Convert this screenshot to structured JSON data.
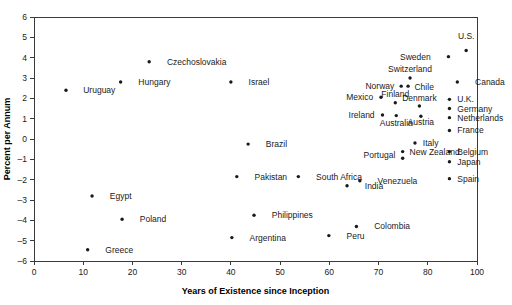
{
  "chart_data": {
    "type": "scatter",
    "title": "",
    "xlabel": "Years of Existence since Inception",
    "ylabel": "Percent per Annum",
    "xlim": [
      0,
      100
    ],
    "ylim": [
      -6,
      6
    ],
    "grid": false,
    "legend": "none",
    "xticks": [
      "0",
      "10",
      "20",
      "30",
      "40",
      "50",
      "60",
      "70",
      "80",
      "100"
    ],
    "yticks": [
      "6",
      "5",
      "4",
      "3",
      "2",
      "1",
      "0",
      "-1",
      "-2",
      "-3",
      "-4",
      "-5",
      "-6"
    ],
    "points": [
      {
        "label": "Uruguay",
        "x": 6.5,
        "y": 2.4,
        "lx": 10,
        "ly": 2.4,
        "anchor": "start"
      },
      {
        "label": "Hungary",
        "x": 17.6,
        "y": 2.8,
        "lx": 21.2,
        "ly": 2.8,
        "anchor": "start"
      },
      {
        "label": "Czechoslovakia",
        "x": 23.4,
        "y": 3.8,
        "lx": 27.0,
        "ly": 3.8,
        "anchor": "start"
      },
      {
        "label": "Israel",
        "x": 40.0,
        "y": 2.8,
        "lx": 43.6,
        "ly": 2.8,
        "anchor": "start"
      },
      {
        "label": "Brazil",
        "x": 43.5,
        "y": -0.25,
        "lx": 47.1,
        "ly": -0.25,
        "anchor": "start"
      },
      {
        "label": "Egypt",
        "x": 11.8,
        "y": -2.8,
        "lx": 15.4,
        "ly": -2.8,
        "anchor": "start"
      },
      {
        "label": "Poland",
        "x": 17.9,
        "y": -3.95,
        "lx": 21.5,
        "ly": -3.95,
        "anchor": "start"
      },
      {
        "label": "Greece",
        "x": 10.9,
        "y": -5.45,
        "lx": 14.5,
        "ly": -5.45,
        "anchor": "start"
      },
      {
        "label": "Pakistan",
        "x": 41.2,
        "y": -1.85,
        "lx": 44.8,
        "ly": -1.85,
        "anchor": "start"
      },
      {
        "label": "South Africa",
        "x": 53.7,
        "y": -1.85,
        "lx": 57.3,
        "ly": -1.85,
        "anchor": "start"
      },
      {
        "label": "Venezuela",
        "x": 66.2,
        "y": -2.05,
        "lx": 69.8,
        "ly": -2.05,
        "anchor": "start"
      },
      {
        "label": "India",
        "x": 63.6,
        "y": -2.3,
        "lx": 67.2,
        "ly": -2.3,
        "anchor": "start"
      },
      {
        "label": "Philippines",
        "x": 44.7,
        "y": -3.75,
        "lx": 48.3,
        "ly": -3.75,
        "anchor": "start"
      },
      {
        "label": "Argentina",
        "x": 40.2,
        "y": -4.85,
        "lx": 43.8,
        "ly": -4.85,
        "anchor": "start"
      },
      {
        "label": "Peru",
        "x": 59.9,
        "y": -4.75,
        "lx": 63.5,
        "ly": -4.75,
        "anchor": "start"
      },
      {
        "label": "Colombia",
        "x": 65.5,
        "y": -4.3,
        "lx": 69.1,
        "ly": -4.3,
        "anchor": "start"
      },
      {
        "label": "U.S.",
        "x": 87.8,
        "y": 4.35,
        "lx": 87.8,
        "ly": 5.05,
        "anchor": "middle"
      },
      {
        "label": "Sweden",
        "x": 84.2,
        "y": 4.05,
        "lx": 80.6,
        "ly": 4.05,
        "anchor": "end"
      },
      {
        "label": "Canada",
        "x": 86.0,
        "y": 2.8,
        "lx": 89.6,
        "ly": 2.8,
        "anchor": "start"
      },
      {
        "label": "Switzerland",
        "x": 76.4,
        "y": 3.0,
        "lx": 76.4,
        "ly": 3.42,
        "anchor": "middle"
      },
      {
        "label": "Chile",
        "x": 76.0,
        "y": 2.6,
        "lx": 77.3,
        "ly": 2.55,
        "anchor": "start"
      },
      {
        "label": "Norway",
        "x": 74.6,
        "y": 2.6,
        "lx": 73.2,
        "ly": 2.6,
        "anchor": "end"
      },
      {
        "label": "Mexico",
        "x": 70.5,
        "y": 2.05,
        "lx": 68.9,
        "ly": 2.05,
        "anchor": "end"
      },
      {
        "label": "Finland",
        "x": 73.4,
        "y": 1.78,
        "lx": 73.4,
        "ly": 2.2,
        "anchor": "middle"
      },
      {
        "label": "Denmark",
        "x": 78.3,
        "y": 1.62,
        "lx": 78.3,
        "ly": 2.02,
        "anchor": "middle"
      },
      {
        "label": "U.K.",
        "x": 84.4,
        "y": 1.95,
        "lx": 86.0,
        "ly": 1.95,
        "anchor": "start"
      },
      {
        "label": "Germany",
        "x": 84.4,
        "y": 1.5,
        "lx": 86.0,
        "ly": 1.5,
        "anchor": "start"
      },
      {
        "label": "Netherlands",
        "x": 84.4,
        "y": 1.05,
        "lx": 86.0,
        "ly": 1.05,
        "anchor": "start"
      },
      {
        "label": "Ireland",
        "x": 70.8,
        "y": 1.18,
        "lx": 69.2,
        "ly": 1.18,
        "anchor": "end"
      },
      {
        "label": "Australia",
        "x": 73.6,
        "y": 1.15,
        "lx": 73.6,
        "ly": 0.78,
        "anchor": "middle"
      },
      {
        "label": "Austria",
        "x": 78.6,
        "y": 1.12,
        "lx": 78.6,
        "ly": 0.82,
        "anchor": "middle"
      },
      {
        "label": "France",
        "x": 84.4,
        "y": 0.42,
        "lx": 86.0,
        "ly": 0.42,
        "anchor": "start"
      },
      {
        "label": "Italy",
        "x": 77.4,
        "y": -0.2,
        "lx": 79.0,
        "ly": -0.2,
        "anchor": "start"
      },
      {
        "label": "New Zealand",
        "x": 74.9,
        "y": -0.62,
        "lx": 76.3,
        "ly": -0.62,
        "anchor": "start"
      },
      {
        "label": "Portugal",
        "x": 74.9,
        "y": -0.95,
        "lx": 73.4,
        "ly": -0.78,
        "anchor": "end"
      },
      {
        "label": "Belgium",
        "x": 84.4,
        "y": -0.62,
        "lx": 86.0,
        "ly": -0.62,
        "anchor": "start"
      },
      {
        "label": "Japan",
        "x": 84.4,
        "y": -1.12,
        "lx": 86.0,
        "ly": -1.12,
        "anchor": "start"
      },
      {
        "label": "Spain",
        "x": 84.4,
        "y": -1.95,
        "lx": 86.0,
        "ly": -1.95,
        "anchor": "start"
      }
    ]
  }
}
